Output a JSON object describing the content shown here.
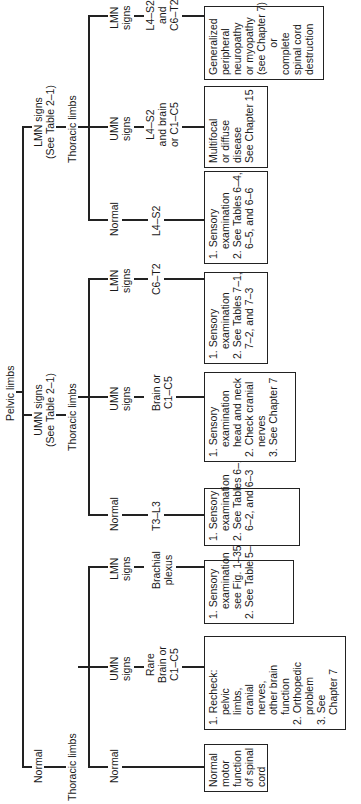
{
  "root": "Pelvic limbs",
  "level1": {
    "normal": "Normal",
    "umn": [
      "UMN signs",
      "(See Table 2–1)"
    ],
    "lmn": [
      "LMN signs",
      "(See Table 2–1)"
    ]
  },
  "thoracic_label": "Thoracic limbs",
  "branches": {
    "normal_normal": {
      "sign": "Normal",
      "region": "",
      "box": [
        "Normal",
        "motor",
        "function",
        "of spinal",
        "cord"
      ]
    },
    "normal_umn": {
      "sign": [
        "UMN",
        "signs"
      ],
      "region": [
        "Rare",
        "Brain or",
        "C1–C5"
      ],
      "box": [
        "1. Recheck:",
        "pelvic",
        "limbs,",
        "cranial",
        "nerves,",
        "other brain",
        "function",
        "2. Orthopedic",
        "problem",
        "3. See",
        "Chapter 7"
      ]
    },
    "normal_lmn": {
      "sign": [
        "LMN",
        "signs"
      ],
      "region": [
        "Brachial",
        "plexus"
      ],
      "box": [
        "1. Sensory",
        "examination",
        "see Fig. 1–35",
        "2. See Table 5–1"
      ]
    },
    "umn_normal": {
      "sign": "Normal",
      "region": "T3–L3",
      "box": [
        "1. Sensory",
        "examination",
        "2. See Tables 6–1,",
        "6–2, and 6–3"
      ]
    },
    "umn_umn": {
      "sign": [
        "UMN",
        "signs"
      ],
      "region": [
        "Brain or",
        "C1–C5"
      ],
      "box": [
        "1. Sensory",
        "examination",
        "head and neck",
        "2. Check cranial",
        "nerves",
        "3. See Chapter 7"
      ]
    },
    "umn_lmn": {
      "sign": [
        "LMN",
        "signs"
      ],
      "region": "C6–T2",
      "box": [
        "1. Sensory",
        "examination",
        "2. See Tables 7–1,",
        "7–2, and 7–3"
      ]
    },
    "lmn_normal": {
      "sign": "Normal",
      "region": "L4–S2",
      "box": [
        "1. Sensory",
        "examination",
        "2. See Tables 6–4,",
        "6–5, and 6–6"
      ]
    },
    "lmn_umn": {
      "sign": [
        "UMN",
        "signs"
      ],
      "region": [
        "L4–S2",
        "and brain",
        "or C1–C5"
      ],
      "box": [
        "Multifocal",
        "or diffuse",
        "disease",
        "See Chapter 15"
      ]
    },
    "lmn_lmn": {
      "sign": [
        "LMN",
        "signs"
      ],
      "region": [
        "L4–S2",
        "and",
        "C6–T2"
      ],
      "box": [
        "Generalized",
        "peripheral",
        "neuropathy",
        "or myopathy",
        "(see Chapter 7)",
        "or",
        "complete",
        "spinal cord",
        "destruction"
      ]
    }
  }
}
